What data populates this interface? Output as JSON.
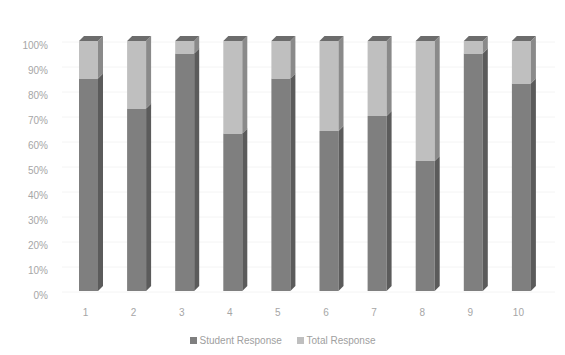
{
  "chart_data": {
    "type": "bar",
    "stacked": true,
    "percent_stacked": true,
    "style": "3d-column",
    "title": "",
    "xlabel": "",
    "ylabel": "",
    "categories": [
      "1",
      "2",
      "3",
      "4",
      "5",
      "6",
      "7",
      "8",
      "9",
      "10"
    ],
    "series": [
      {
        "name": "Student Response",
        "color": "#7f7f7f",
        "values": [
          85,
          73,
          95,
          63,
          85,
          64,
          70,
          52,
          95,
          83
        ]
      },
      {
        "name": "Total Response",
        "color": "#bfbfbf",
        "values": [
          15,
          27,
          5,
          37,
          15,
          36,
          30,
          48,
          5,
          17
        ]
      }
    ],
    "yticks": [
      "0%",
      "10%",
      "20%",
      "30%",
      "40%",
      "50%",
      "60%",
      "70%",
      "80%",
      "90%",
      "100%"
    ],
    "ylim": [
      0,
      100
    ],
    "grid": true,
    "legend_position": "bottom"
  },
  "legend": {
    "items": [
      {
        "label": "Student Response",
        "color": "#7f7f7f"
      },
      {
        "label": "Total Response",
        "color": "#bfbfbf"
      }
    ]
  }
}
